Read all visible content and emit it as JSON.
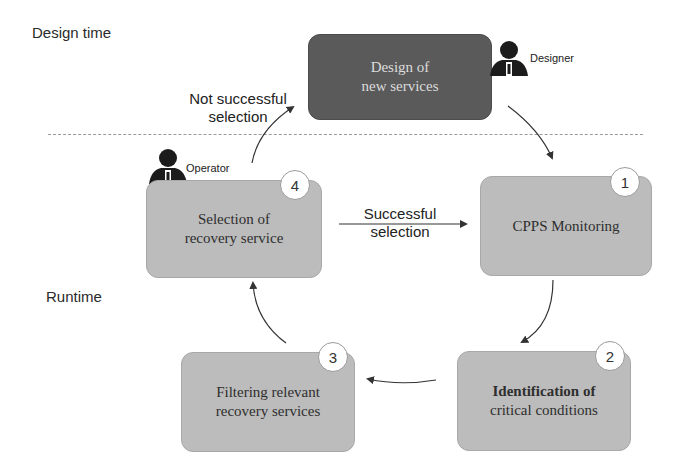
{
  "phases": {
    "design_time": "Design time",
    "runtime": "Runtime"
  },
  "nodes": [
    {
      "id": "design",
      "label": "Design of\nnew services",
      "style": "dark"
    },
    {
      "id": "monitoring",
      "step": "1",
      "label": "CPPS Monitoring"
    },
    {
      "id": "identification",
      "step": "2",
      "label_line1": "Identification of",
      "label_line2": "critical conditions"
    },
    {
      "id": "filtering",
      "step": "3",
      "label": "Filtering relevant\nrecovery services"
    },
    {
      "id": "selection",
      "step": "4",
      "label": "Selection of\nrecovery service"
    }
  ],
  "edges": {
    "not_successful": "Not successful\nselection",
    "successful": "Successful\nselection"
  },
  "actors": {
    "designer": "Designer",
    "operator": "Operator"
  },
  "colors": {
    "box_fill": "#bcbcbc",
    "dark_box_fill": "#5a5a5a",
    "arrow": "#333333",
    "divider": "#9a9a9a"
  }
}
